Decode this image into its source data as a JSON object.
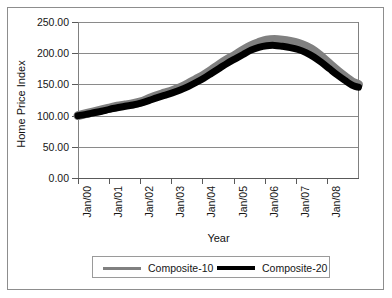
{
  "chart_data": {
    "type": "line",
    "title": "",
    "xlabel": "Year",
    "ylabel": "Home Price Index",
    "grid": true,
    "legend_position": "bottom",
    "ylim": [
      0,
      250
    ],
    "yticks": [
      "0.00",
      "50.00",
      "100.00",
      "150.00",
      "200.00",
      "250.00"
    ],
    "ytick_values": [
      0,
      50,
      100,
      150,
      200,
      250
    ],
    "categories": [
      "Jan/00",
      "Jan/01",
      "Jan/02",
      "Jan/03",
      "Jan/04",
      "Jan/05",
      "Jan/06",
      "Jan/07",
      "Jan/08"
    ],
    "x": [
      2000.0,
      2001.0,
      2002.0,
      2003.0,
      2004.0,
      2005.0,
      2006.0,
      2007.0,
      2008.0
    ],
    "series": [
      {
        "name": "Composite-10",
        "color": "#808080",
        "x": [
          2000.0,
          2000.25,
          2000.5,
          2000.75,
          2001.0,
          2001.25,
          2001.5,
          2001.75,
          2002.0,
          2002.25,
          2002.5,
          2002.75,
          2003.0,
          2003.25,
          2003.5,
          2003.75,
          2004.0,
          2004.25,
          2004.5,
          2004.75,
          2005.0,
          2005.25,
          2005.5,
          2005.75,
          2006.0,
          2006.25,
          2006.5,
          2006.75,
          2007.0,
          2007.25,
          2007.5,
          2007.75,
          2008.0,
          2008.25,
          2008.5,
          2008.75,
          2008.92
        ],
        "values": [
          100.0,
          103.0,
          106.0,
          109.0,
          112.0,
          115.0,
          117.0,
          119.0,
          122.0,
          127.0,
          132.0,
          136.0,
          140.0,
          145.0,
          151.0,
          158.0,
          165.0,
          173.0,
          182.0,
          190.0,
          197.0,
          205.0,
          212.0,
          217.0,
          221.0,
          222.0,
          221.0,
          219.0,
          216.0,
          211.0,
          204.0,
          194.0,
          183.0,
          172.0,
          162.0,
          153.0,
          150.0
        ]
      },
      {
        "name": "Composite-20",
        "color": "#000000",
        "x": [
          2000.0,
          2000.25,
          2000.5,
          2000.75,
          2001.0,
          2001.25,
          2001.5,
          2001.75,
          2002.0,
          2002.25,
          2002.5,
          2002.75,
          2003.0,
          2003.25,
          2003.5,
          2003.75,
          2004.0,
          2004.25,
          2004.5,
          2004.75,
          2005.0,
          2005.25,
          2005.5,
          2005.75,
          2006.0,
          2006.25,
          2006.5,
          2006.75,
          2007.0,
          2007.25,
          2007.5,
          2007.75,
          2008.0,
          2008.25,
          2008.5,
          2008.75,
          2008.92
        ],
        "values": [
          100.0,
          102.0,
          104.5,
          107.0,
          110.0,
          112.5,
          115.0,
          117.0,
          120.0,
          124.0,
          128.5,
          132.5,
          136.5,
          141.0,
          146.5,
          153.0,
          160.0,
          168.0,
          176.0,
          184.0,
          191.0,
          198.0,
          205.0,
          209.5,
          212.0,
          212.5,
          211.0,
          209.0,
          206.0,
          201.0,
          194.0,
          185.0,
          175.0,
          165.0,
          156.0,
          148.0,
          145.5
        ]
      }
    ],
    "annotations": []
  },
  "axes": {
    "y_title": "Home Price Index",
    "x_title": "Year",
    "y_tick_labels": [
      "250.00",
      "200.00",
      "150.00",
      "100.00",
      "50.00",
      "0.00"
    ],
    "x_tick_labels": [
      "Jan/00",
      "Jan/01",
      "Jan/02",
      "Jan/03",
      "Jan/04",
      "Jan/05",
      "Jan/06",
      "Jan/07",
      "Jan/08"
    ]
  },
  "legend": {
    "items": [
      {
        "label": "Composite-10",
        "color": "#808080"
      },
      {
        "label": "Composite-20",
        "color": "#000000"
      }
    ]
  },
  "colors": {
    "composite10": "#808080",
    "composite20": "#000000",
    "grid": "#8a8a8a",
    "axis": "#595959",
    "frame": "#8d8d8d",
    "background": "#ffffff"
  }
}
